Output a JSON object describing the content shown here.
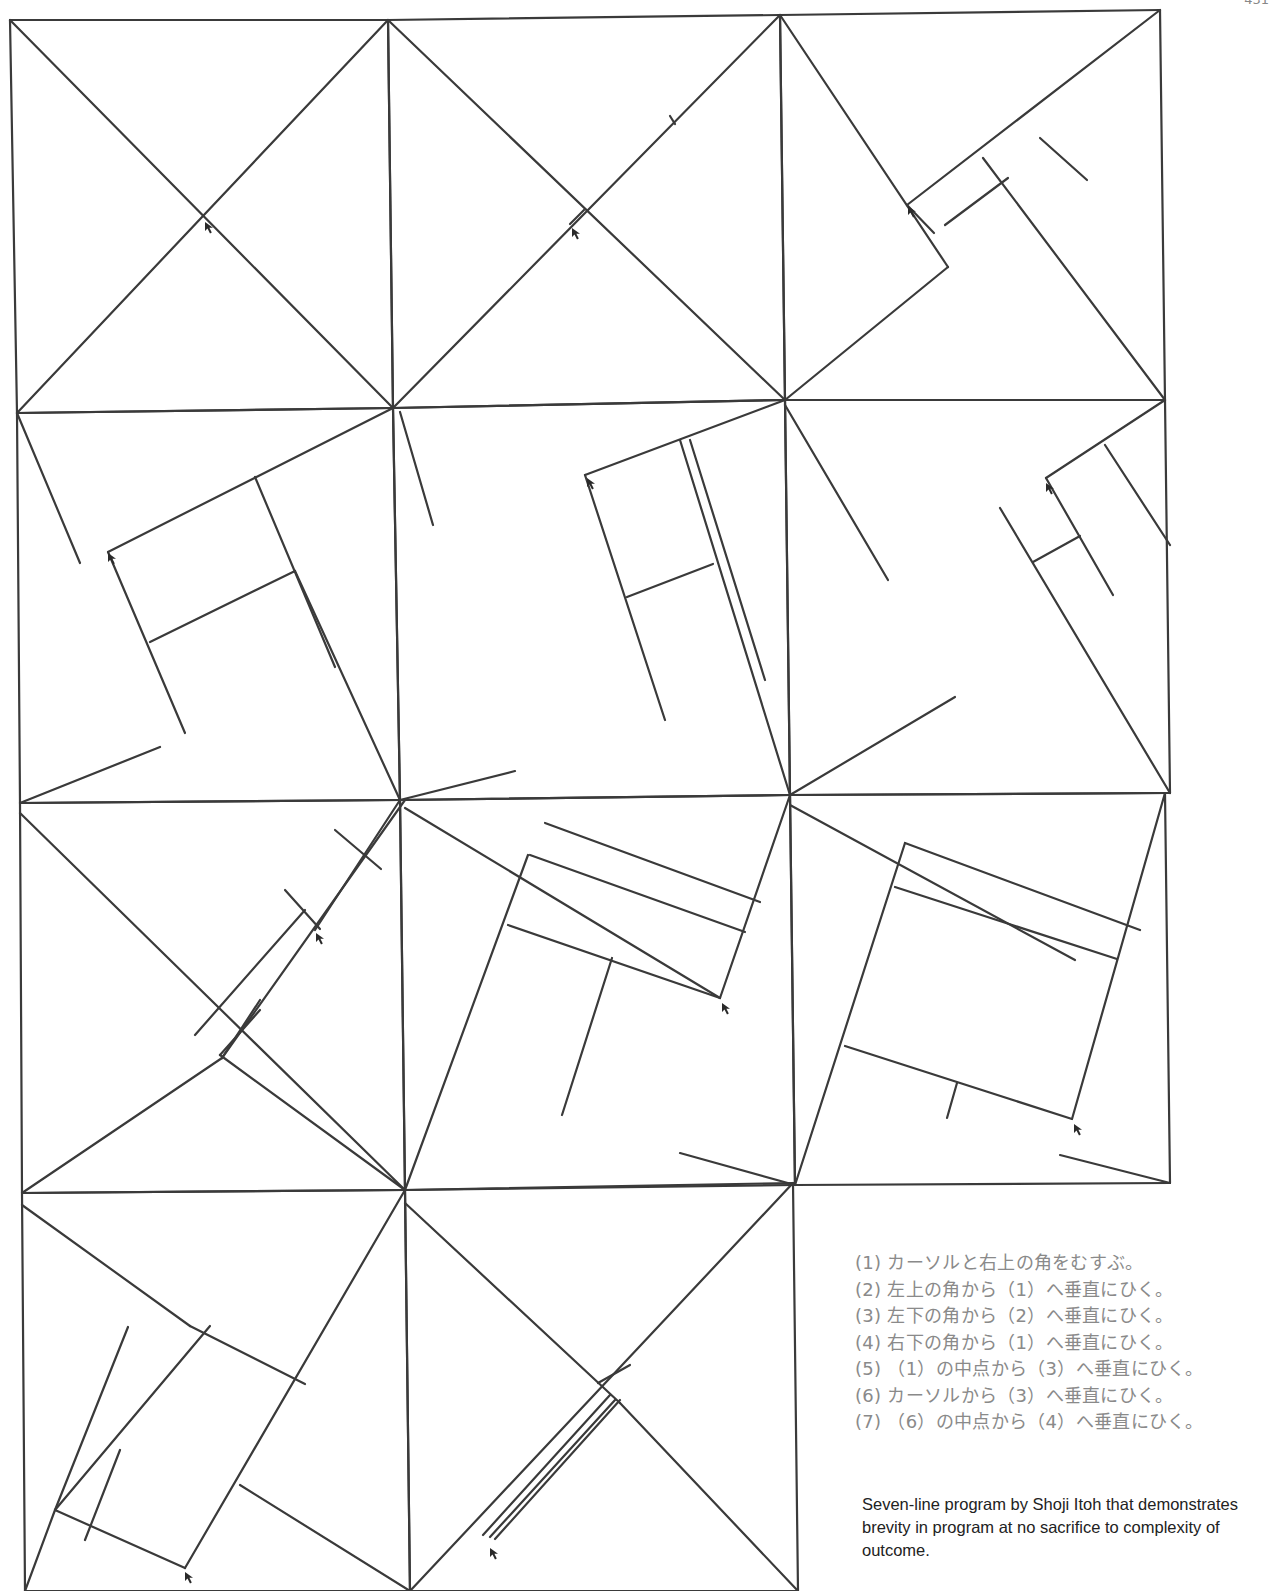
{
  "page": {
    "page_number": "431"
  },
  "figure": {
    "stroke_color": "#3a3a3a",
    "frames": [
      {
        "id": 1,
        "border": [
          [
            10,
            20
          ],
          [
            388,
            20
          ],
          [
            393,
            408
          ],
          [
            17,
            413
          ]
        ],
        "lines": [
          [
            10,
            20,
            393,
            408
          ],
          [
            388,
            20,
            17,
            413
          ]
        ],
        "cursor": [
          205,
          222
        ]
      },
      {
        "id": 2,
        "border": [
          [
            388,
            20
          ],
          [
            780,
            15
          ],
          [
            785,
            400
          ],
          [
            393,
            408
          ]
        ],
        "lines": [
          [
            388,
            20,
            785,
            400
          ],
          [
            780,
            15,
            393,
            408
          ],
          [
            670,
            116,
            675,
            124
          ],
          [
            570,
            224,
            584,
            210
          ]
        ],
        "cursor": [
          572,
          228
        ]
      },
      {
        "id": 3,
        "border": [
          [
            780,
            15
          ],
          [
            1160,
            10
          ],
          [
            1165,
            400
          ],
          [
            785,
            400
          ]
        ],
        "lines": [
          [
            780,
            15,
            948,
            267
          ],
          [
            1160,
            10,
            907,
            205
          ],
          [
            948,
            267,
            785,
            400
          ],
          [
            907,
            205,
            934,
            233
          ],
          [
            983,
            158,
            1165,
            400
          ],
          [
            1040,
            138,
            1087,
            180
          ],
          [
            945,
            225,
            1008,
            178
          ]
        ],
        "cursor": [
          908,
          206
        ]
      },
      {
        "id": 4,
        "border": [
          [
            17,
            413
          ],
          [
            393,
            408
          ],
          [
            400,
            800
          ],
          [
            20,
            803
          ]
        ],
        "lines": [
          [
            17,
            413,
            80,
            563
          ],
          [
            108,
            552,
            393,
            408
          ],
          [
            108,
            552,
            185,
            733
          ],
          [
            150,
            642,
            295,
            571
          ],
          [
            295,
            571,
            400,
            800
          ],
          [
            255,
            477,
            335,
            667
          ],
          [
            20,
            803,
            160,
            747
          ]
        ],
        "cursor": [
          108,
          553
        ]
      },
      {
        "id": 5,
        "border": [
          [
            393,
            408
          ],
          [
            785,
            400
          ],
          [
            790,
            795
          ],
          [
            400,
            800
          ]
        ],
        "lines": [
          [
            400,
            412,
            433,
            525
          ],
          [
            585,
            475,
            785,
            400
          ],
          [
            585,
            475,
            665,
            720
          ],
          [
            627,
            597,
            713,
            564
          ],
          [
            680,
            440,
            790,
            795
          ],
          [
            690,
            440,
            765,
            680
          ],
          [
            400,
            800,
            515,
            771
          ]
        ],
        "cursor": [
          587,
          478
        ]
      },
      {
        "id": 6,
        "border": [
          [
            785,
            400
          ],
          [
            1165,
            400
          ],
          [
            1170,
            793
          ],
          [
            790,
            795
          ]
        ],
        "lines": [
          [
            785,
            405,
            888,
            580
          ],
          [
            1046,
            478,
            1165,
            400
          ],
          [
            1046,
            478,
            1113,
            595
          ],
          [
            1033,
            562,
            1080,
            536
          ],
          [
            1105,
            445,
            1170,
            545
          ],
          [
            1000,
            508,
            1170,
            793
          ],
          [
            790,
            795,
            955,
            697
          ]
        ],
        "cursor": [
          1046,
          483
        ]
      },
      {
        "id": 7,
        "border": [
          [
            20,
            803
          ],
          [
            400,
            800
          ],
          [
            405,
            1190
          ],
          [
            22,
            1193
          ]
        ],
        "lines": [
          [
            20,
            813,
            405,
            1190
          ],
          [
            405,
            800,
            222,
            1058
          ],
          [
            335,
            830,
            381,
            869
          ],
          [
            400,
            800,
            315,
            930
          ],
          [
            285,
            890,
            320,
            929
          ],
          [
            305,
            910,
            195,
            1035
          ],
          [
            222,
            1058,
            22,
            1193
          ],
          [
            222,
            1058,
            260,
            1000
          ],
          [
            220,
            1055,
            260,
            1010
          ],
          [
            220,
            1055,
            405,
            1190
          ]
        ],
        "cursor": [
          316,
          933
        ]
      },
      {
        "id": 8,
        "border": [
          [
            400,
            800
          ],
          [
            790,
            795
          ],
          [
            795,
            1185
          ],
          [
            405,
            1190
          ]
        ],
        "lines": [
          [
            405,
            808,
            720,
            998
          ],
          [
            545,
            823,
            760,
            902
          ],
          [
            530,
            855,
            745,
            932
          ],
          [
            790,
            795,
            720,
            998
          ],
          [
            528,
            855,
            405,
            1190
          ],
          [
            508,
            925,
            720,
            998
          ],
          [
            612,
            958,
            562,
            1115
          ],
          [
            680,
            1153,
            795,
            1185
          ]
        ],
        "cursor": [
          722,
          1003
        ]
      },
      {
        "id": 9,
        "border": [
          [
            790,
            795
          ],
          [
            1165,
            793
          ],
          [
            1170,
            1183
          ],
          [
            795,
            1185
          ]
        ],
        "lines": [
          [
            790,
            805,
            1075,
            960
          ],
          [
            905,
            843,
            1140,
            930
          ],
          [
            895,
            887,
            1117,
            959
          ],
          [
            1165,
            793,
            1072,
            1119
          ],
          [
            905,
            843,
            795,
            1185
          ],
          [
            845,
            1046,
            1072,
            1119
          ],
          [
            957,
            1083,
            947,
            1118
          ],
          [
            1060,
            1155,
            1170,
            1183
          ]
        ],
        "cursor": [
          1074,
          1124
        ]
      },
      {
        "id": 10,
        "border": [
          [
            22,
            1193
          ],
          [
            405,
            1190
          ],
          [
            410,
            1591
          ],
          [
            25,
            1591
          ]
        ],
        "lines": [
          [
            22,
            1205,
            190,
            1326
          ],
          [
            190,
            1326,
            305,
            1384
          ],
          [
            405,
            1190,
            185,
            1568
          ],
          [
            128,
            1327,
            55,
            1510
          ],
          [
            210,
            1326,
            55,
            1510
          ],
          [
            55,
            1510,
            185,
            1568
          ],
          [
            120,
            1450,
            85,
            1540
          ],
          [
            240,
            1485,
            410,
            1591
          ],
          [
            25,
            1591,
            55,
            1510
          ]
        ],
        "cursor": [
          185,
          1572
        ]
      },
      {
        "id": 11,
        "border": [
          [
            405,
            1190
          ],
          [
            793,
            1183
          ],
          [
            798,
            1591
          ],
          [
            410,
            1591
          ]
        ],
        "lines": [
          [
            405,
            1203,
            620,
            1403
          ],
          [
            793,
            1183,
            410,
            1591
          ],
          [
            598,
            1383,
            630,
            1365
          ],
          [
            610,
            1395,
            483,
            1535
          ],
          [
            615,
            1400,
            490,
            1537
          ],
          [
            620,
            1400,
            495,
            1539
          ],
          [
            620,
            1403,
            798,
            1591
          ]
        ],
        "cursor": [
          490,
          1548
        ]
      }
    ]
  },
  "instructions": {
    "steps": [
      "(1) カーソルと右上の角をむすぶ。",
      "(2) 左上の角から（1）へ垂直にひく。",
      "(3) 左下の角から（2）へ垂直にひく。",
      "(4) 右下の角から（1）へ垂直にひく。",
      "(5) （1）の中点から（3）へ垂直にひく。",
      "(6) カーソルから（3）へ垂直にひく。",
      "(7) （6）の中点から（4）へ垂直にひく。"
    ]
  },
  "caption": {
    "text": "Seven-line program by Shoji Itoh that demonstrates brevity in program at no sacrifice to complexity of outcome."
  }
}
